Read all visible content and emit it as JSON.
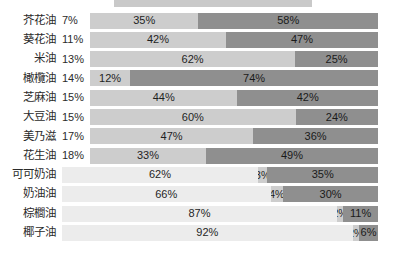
{
  "chart_data": {
    "type": "bar",
    "subtype": "stacked-horizontal-100pct",
    "title": "",
    "xlabel": "",
    "ylabel": "",
    "xlim": [
      0,
      100
    ],
    "grid": false,
    "legend_position": "top-clipped",
    "units": "%",
    "categories": [
      "芥花油",
      "葵花油",
      "米油",
      "橄欖油",
      "芝麻油",
      "大豆油",
      "美乃滋",
      "花生油",
      "可可奶油",
      "奶油油",
      "棕櫚油",
      "椰子油"
    ],
    "series": [
      {
        "name": "saturated",
        "color": "#ececec",
        "values": [
          7,
          11,
          13,
          14,
          15,
          15,
          17,
          18,
          62,
          66,
          87,
          92
        ]
      },
      {
        "name": "polyunsaturated",
        "color": "#cdcdcd",
        "values": [
          35,
          42,
          62,
          12,
          44,
          60,
          47,
          33,
          3,
          4,
          2,
          2
        ]
      },
      {
        "name": "monounsaturated",
        "color": "#8f8f8f",
        "values": [
          58,
          47,
          25,
          74,
          42,
          24,
          36,
          49,
          35,
          30,
          11,
          6
        ]
      }
    ]
  },
  "rows": [
    {
      "label": "芥花油",
      "layout": "labeled",
      "lead": "7%",
      "segments": [
        {
          "pct": 35,
          "text": "35%",
          "tone": "poly"
        },
        {
          "pct": 58,
          "text": "58%",
          "tone": "mono"
        }
      ]
    },
    {
      "label": "葵花油",
      "layout": "labeled",
      "lead": "11%",
      "segments": [
        {
          "pct": 42,
          "text": "42%",
          "tone": "poly"
        },
        {
          "pct": 47,
          "text": "47%",
          "tone": "mono"
        }
      ]
    },
    {
      "label": "米油",
      "layout": "labeled",
      "lead": "13%",
      "segments": [
        {
          "pct": 62,
          "text": "62%",
          "tone": "poly"
        },
        {
          "pct": 25,
          "text": "25%",
          "tone": "mono"
        }
      ]
    },
    {
      "label": "橄欖油",
      "layout": "labeled",
      "lead": "14%",
      "segments": [
        {
          "pct": 12,
          "text": "12%",
          "tone": "poly"
        },
        {
          "pct": 74,
          "text": "74%",
          "tone": "mono"
        }
      ]
    },
    {
      "label": "芝麻油",
      "layout": "labeled",
      "lead": "15%",
      "segments": [
        {
          "pct": 44,
          "text": "44%",
          "tone": "poly"
        },
        {
          "pct": 42,
          "text": "42%",
          "tone": "mono"
        }
      ]
    },
    {
      "label": "大豆油",
      "layout": "labeled",
      "lead": "15%",
      "segments": [
        {
          "pct": 60,
          "text": "60%",
          "tone": "poly"
        },
        {
          "pct": 24,
          "text": "24%",
          "tone": "mono"
        }
      ]
    },
    {
      "label": "美乃滋",
      "layout": "labeled",
      "lead": "17%",
      "segments": [
        {
          "pct": 47,
          "text": "47%",
          "tone": "poly"
        },
        {
          "pct": 36,
          "text": "36%",
          "tone": "mono"
        }
      ]
    },
    {
      "label": "花生油",
      "layout": "labeled",
      "lead": "18%",
      "segments": [
        {
          "pct": 33,
          "text": "33%",
          "tone": "poly"
        },
        {
          "pct": 49,
          "text": "49%",
          "tone": "mono"
        }
      ]
    },
    {
      "label": "可可奶油",
      "layout": "wide",
      "lead": "",
      "segments": [
        {
          "pct": 62,
          "text": "62%",
          "tone": "sat"
        },
        {
          "pct": 3,
          "text": "3%",
          "tone": "poly"
        },
        {
          "pct": 35,
          "text": "35%",
          "tone": "mono"
        }
      ]
    },
    {
      "label": "奶油油",
      "layout": "wide",
      "lead": "",
      "segments": [
        {
          "pct": 66,
          "text": "66%",
          "tone": "sat"
        },
        {
          "pct": 4,
          "text": "4%",
          "tone": "poly"
        },
        {
          "pct": 30,
          "text": "30%",
          "tone": "mono"
        }
      ]
    },
    {
      "label": "棕櫚油",
      "layout": "wide",
      "lead": "",
      "segments": [
        {
          "pct": 87,
          "text": "87%",
          "tone": "sat"
        },
        {
          "pct": 2,
          "text": "2%",
          "tone": "poly"
        },
        {
          "pct": 11,
          "text": "11%",
          "tone": "mono"
        }
      ]
    },
    {
      "label": "椰子油",
      "layout": "wide",
      "lead": "",
      "segments": [
        {
          "pct": 92,
          "text": "92%",
          "tone": "sat"
        },
        {
          "pct": 2,
          "text": "2%",
          "tone": "poly"
        },
        {
          "pct": 6,
          "text": "6%",
          "tone": "mono"
        }
      ]
    }
  ],
  "colors": {
    "saturated": "#ececec",
    "polyunsaturated": "#cdcdcd",
    "monounsaturated": "#8f8f8f",
    "top_clip_bar": "#c9c9c9",
    "text": "#2b2b2b",
    "background": "#ffffff"
  }
}
